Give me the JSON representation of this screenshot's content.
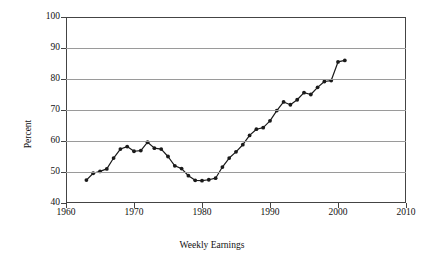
{
  "chart_data": {
    "type": "line",
    "title": "",
    "xlabel": "Weekly Earnings",
    "ylabel": "Percent",
    "xlim": [
      1960,
      2010
    ],
    "ylim": [
      40,
      100
    ],
    "xticks": [
      1960,
      1970,
      1980,
      1990,
      2000,
      2010
    ],
    "yticks": [
      40,
      50,
      60,
      70,
      80,
      90,
      100
    ],
    "grid": true,
    "legend": "none",
    "marker": "filled-circle",
    "line_color": "#1a1a1a",
    "grid_color": "#9a9a9a",
    "x": [
      1963,
      1964,
      1965,
      1966,
      1967,
      1968,
      1969,
      1970,
      1971,
      1972,
      1973,
      1974,
      1975,
      1976,
      1977,
      1978,
      1979,
      1980,
      1981,
      1982,
      1983,
      1984,
      1985,
      1986,
      1987,
      1988,
      1989,
      1990,
      1991,
      1992,
      1993,
      1994,
      1995,
      1996,
      1997,
      1998,
      1999,
      2000,
      2001
    ],
    "values": [
      47.4,
      49.6,
      50.2,
      51.0,
      54.5,
      57.4,
      58.2,
      56.7,
      56.9,
      59.6,
      57.7,
      57.4,
      55.0,
      52.0,
      51.1,
      48.8,
      47.3,
      47.2,
      47.5,
      48.0,
      51.6,
      54.5,
      56.5,
      58.8,
      61.8,
      63.8,
      64.3,
      66.5,
      69.8,
      72.6,
      71.7,
      73.3,
      75.6,
      75.0,
      77.3,
      79.2,
      79.5,
      85.5,
      86.0
    ],
    "series_name": "Percent"
  },
  "axis": {
    "y_title": "Percent",
    "x_title": "Weekly Earnings"
  }
}
